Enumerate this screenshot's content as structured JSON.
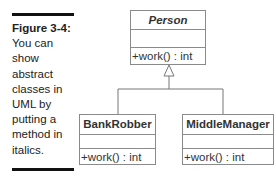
{
  "caption": {
    "label": "Figure 3-4:",
    "text": "You can show abstract classes in UML by putting a method in italics."
  },
  "classes": [
    {
      "name": "Person",
      "abstract": true,
      "attributes": [],
      "operations": [
        "+work() : int"
      ]
    },
    {
      "name": "BankRobber",
      "abstract": false,
      "attributes": [],
      "operations": [
        "+work() : int"
      ]
    },
    {
      "name": "MiddleManager",
      "abstract": false,
      "attributes": [],
      "operations": [
        "+work() : int"
      ]
    }
  ],
  "relationships": [
    {
      "type": "generalization",
      "from": "BankRobber",
      "to": "Person"
    },
    {
      "type": "generalization",
      "from": "MiddleManager",
      "to": "Person"
    }
  ]
}
